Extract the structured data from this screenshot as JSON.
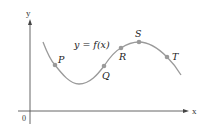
{
  "diagram": {
    "function_label": "y = f(x)",
    "axes": {
      "x_label": "x",
      "y_label": "y",
      "origin_label": "0"
    },
    "points": [
      {
        "label": "P",
        "x": 55,
        "y": 65
      },
      {
        "label": "Q",
        "x": 104,
        "y": 66
      },
      {
        "label": "R",
        "x": 121,
        "y": 48
      },
      {
        "label": "S",
        "x": 139,
        "y": 42
      },
      {
        "label": "T",
        "x": 167,
        "y": 57
      }
    ],
    "colors": {
      "curve": "#9a9a9a",
      "points": "#9a9a9a",
      "axes": "#555555",
      "text": "#222222"
    }
  }
}
